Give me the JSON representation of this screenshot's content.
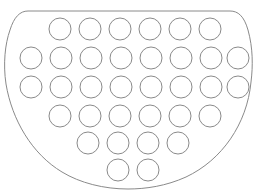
{
  "figure": {
    "canvas": {
      "width": 258,
      "height": 195,
      "background": "#ffffff"
    },
    "outline": {
      "name": "d-shaped-boundary",
      "stroke": "#8a8a8a",
      "stroke_width": 1,
      "fill": "none",
      "path": "M 28 11 L 230 11 C 238 11 244 16 248 30 C 253 48 253 66 251 82 C 247 124 222 160 186 177 C 166 186 146 189 128 189 C 104 189 80 183 62 172 C 32 154 12 120 6 84 C 3 64 5 44 10 30 C 14 17 20 11 28 11 Z"
    },
    "circles": {
      "name": "circle-grid",
      "radius": 11,
      "stroke": "#8a8a8a",
      "stroke_width": 1,
      "fill": "none",
      "count": 34,
      "row_counts": [
        6,
        8,
        8,
        6,
        4,
        2
      ],
      "rows": [
        {
          "cy": 29,
          "cx": [
            60,
            90,
            120,
            150,
            180,
            210
          ]
        },
        {
          "cy": 58,
          "cx": [
            31,
            61,
            91,
            121,
            151,
            181,
            211,
            238
          ]
        },
        {
          "cy": 87,
          "cx": [
            31,
            61,
            91,
            121,
            151,
            181,
            211,
            238
          ]
        },
        {
          "cy": 116,
          "cx": [
            60,
            90,
            120,
            150,
            180,
            210
          ]
        },
        {
          "cy": 143,
          "cx": [
            88,
            118,
            148,
            178
          ]
        },
        {
          "cy": 170,
          "cx": [
            118,
            148
          ]
        }
      ]
    }
  }
}
